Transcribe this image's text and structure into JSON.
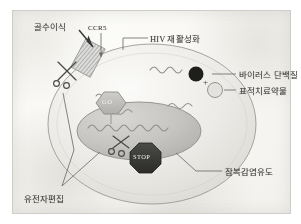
{
  "figure": {
    "background_color": "#f7f6f3",
    "frame_color": "#cfcdc8",
    "ink_color": "#6b6a66"
  },
  "labels": {
    "bone_marrow_transplant": "골수이식",
    "ccr5_receptor": "CCR5",
    "hiv_reactivation": "HIV 재활성화",
    "viral_protein": "바이러스 단백질",
    "targeted_drug": "표적치료약물",
    "latency_induction": "잠복감염유도",
    "gene_editing": "유전자편집"
  },
  "signs": {
    "go": "GO",
    "stop": "STOP"
  },
  "symbols": {
    "plus": "+"
  },
  "colors": {
    "cell_membrane": "#e9e8e4",
    "cytoplasm": "#efeeea",
    "nucleus": "#c9c8c4",
    "go_sign": "#bcbbb7",
    "stop_sign": "#3a3a38",
    "viral_protein_dot": "#1e1e1c",
    "drug_circle": "#dddcd8",
    "rna_squiggle": "#8e8d88"
  },
  "elements": {
    "cell": "host-cell",
    "nucleus": "cell-nucleus",
    "scissors_membrane": "scissors-icon",
    "scissors_nucleus": "scissors-icon",
    "rna_strands": 4
  }
}
